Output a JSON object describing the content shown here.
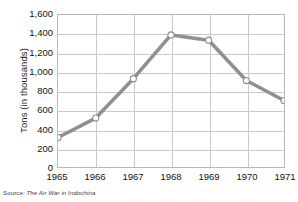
{
  "chart_data": {
    "type": "line",
    "title": "",
    "xlabel": "",
    "ylabel": "Tons (in thousands)",
    "categories": [
      "1965",
      "1966",
      "1967",
      "1968",
      "1969",
      "1970",
      "1971"
    ],
    "values": [
      310,
      515,
      930,
      1390,
      1335,
      910,
      700
    ],
    "series": [
      {
        "name": "Tons",
        "values": [
          310,
          515,
          930,
          1390,
          1335,
          910,
          700
        ]
      }
    ],
    "ylim": [
      0,
      1600
    ],
    "ytick_values": [
      0,
      200,
      400,
      600,
      800,
      1000,
      1200,
      1400,
      1600
    ],
    "ytick_labels": [
      "0",
      "200",
      "400",
      "600",
      "800",
      "1,000",
      "1,200",
      "1,400",
      "1,600"
    ],
    "xtick_labels": [
      "1965",
      "1966",
      "1967",
      "1968",
      "1969",
      "1970",
      "1971"
    ],
    "grid": true,
    "legend": "none",
    "line_color": "#909090",
    "marker_face_color": "#ffffff",
    "marker_edge_color": "#8d8d8d",
    "gridline_color": "#c9c9c9",
    "axis_color": "#b9b9b9"
  },
  "source": {
    "label": "Source: ",
    "title": "The Air War in Indochina"
  }
}
